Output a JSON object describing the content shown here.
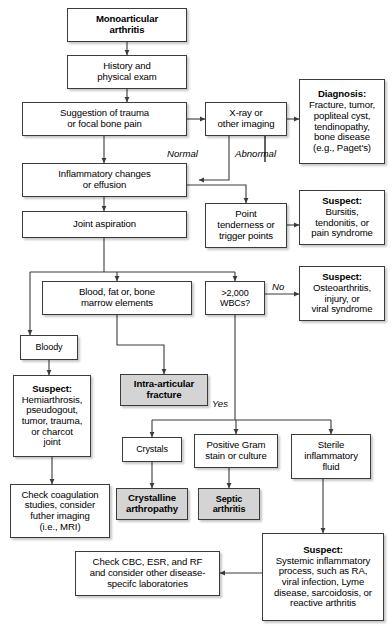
{
  "diagram": {
    "type": "clinical-flowchart",
    "nodes": [
      {
        "id": "monoarticular",
        "label": "Monoarticular\narthritis",
        "style": "bold",
        "x": 67,
        "y": 8,
        "w": 120,
        "h": 34
      },
      {
        "id": "history",
        "label": "History and\nphysical exam",
        "style": "plain",
        "x": 67,
        "y": 55,
        "w": 120,
        "h": 34
      },
      {
        "id": "suggestion",
        "label": "Suggestion of trauma\nor focal bone pain",
        "style": "plain",
        "x": 22,
        "y": 102,
        "w": 165,
        "h": 34
      },
      {
        "id": "xray",
        "label": "X-ray or\nother imaging",
        "style": "plain",
        "x": 205,
        "y": 102,
        "w": 82,
        "h": 34
      },
      {
        "id": "diagnosis",
        "label": "Fracture, tumor,\npopliteal cyst,\ntendinopathy,\nbone disease\n(e.g., Paget's)",
        "header": "Diagnosis:",
        "style": "header",
        "x": 299,
        "y": 79,
        "w": 86,
        "h": 85
      },
      {
        "id": "inflammatory",
        "label": "Inflammatory changes\nor effusion",
        "style": "plain",
        "x": 22,
        "y": 163,
        "w": 165,
        "h": 34
      },
      {
        "id": "jointasp",
        "label": "Joint aspiration",
        "style": "plain",
        "x": 22,
        "y": 211,
        "w": 165,
        "h": 27
      },
      {
        "id": "point",
        "label": "Point\ntenderness or\ntrigger points",
        "style": "plain",
        "x": 205,
        "y": 203,
        "w": 82,
        "h": 45
      },
      {
        "id": "suspect_bursitis",
        "label": "Bursitis,\ntendonitis, or\npain syndrome",
        "header": "Suspect:",
        "style": "header",
        "x": 299,
        "y": 190,
        "w": 86,
        "h": 55
      },
      {
        "id": "bloodfat",
        "label": "Blood, fat or, bone\nmarrow elements",
        "style": "plain",
        "x": 42,
        "y": 281,
        "w": 150,
        "h": 34
      },
      {
        "id": "wbc",
        "label": ">2,000\nWBCs?",
        "style": "plain",
        "x": 205,
        "y": 281,
        "w": 60,
        "h": 34
      },
      {
        "id": "suspect_osteo",
        "label": "Osteoarthritis,\ninjury, or\nviral syndrome",
        "header": "Suspect:",
        "style": "header",
        "x": 299,
        "y": 266,
        "w": 86,
        "h": 55
      },
      {
        "id": "bloody",
        "label": "Bloody",
        "style": "plain",
        "x": 20,
        "y": 335,
        "w": 58,
        "h": 25
      },
      {
        "id": "suspect_hemi",
        "label": "Hemiarthrosis,\npseudogout,\ntumor, trauma,\nor charcot\njoint",
        "header": "Suspect:",
        "style": "header",
        "x": 13,
        "y": 375,
        "w": 78,
        "h": 82
      },
      {
        "id": "intraarticular",
        "label": "Intra-articular\nfracture",
        "style": "shaded",
        "x": 120,
        "y": 374,
        "w": 88,
        "h": 32
      },
      {
        "id": "checkcoag",
        "label": "Check coagulation\nstudies, consider\nfuther imaging\n(i.e., MRI)",
        "style": "plain",
        "x": 10,
        "y": 484,
        "w": 100,
        "h": 54
      },
      {
        "id": "crystals",
        "label": "Crystals",
        "style": "plain",
        "x": 122,
        "y": 437,
        "w": 60,
        "h": 25
      },
      {
        "id": "gram",
        "label": "Positive Gram\nstain or culture",
        "style": "plain",
        "x": 194,
        "y": 434,
        "w": 84,
        "h": 34
      },
      {
        "id": "sterile",
        "label": "Sterile\ninflammatory\nfluid",
        "style": "plain",
        "x": 291,
        "y": 434,
        "w": 80,
        "h": 45
      },
      {
        "id": "crystalline",
        "label": "Crystalline\narthropathy",
        "style": "shaded",
        "x": 116,
        "y": 488,
        "w": 72,
        "h": 32
      },
      {
        "id": "septic",
        "label": "Septic\narthritis",
        "style": "shaded",
        "x": 198,
        "y": 488,
        "w": 62,
        "h": 32
      },
      {
        "id": "checkcbc",
        "label": "Check CBC, ESR, and RF\nand consider other disease-\nspecifc laboratories",
        "style": "plain",
        "x": 75,
        "y": 551,
        "w": 145,
        "h": 45
      },
      {
        "id": "suspect_systemic",
        "label": "Systemic inflammatory\nprocess, such as RA,\nviral infection, Lyme\ndisease, sarcoidosis, or\nreactive arthritis",
        "header": "Suspect:",
        "style": "header",
        "x": 262,
        "y": 533,
        "w": 122,
        "h": 88
      }
    ],
    "edge_labels": [
      {
        "id": "normal",
        "text": "Normal",
        "x": 167,
        "y": 148
      },
      {
        "id": "abnormal",
        "text": "Abnormal",
        "x": 235,
        "y": 148
      },
      {
        "id": "no",
        "text": "No",
        "x": 272,
        "y": 281
      },
      {
        "id": "yes",
        "text": "Yes",
        "x": 212,
        "y": 398
      }
    ],
    "colors": {
      "border": "#3b3b3b",
      "box_fill": "#ffffff",
      "shaded_fill": "#d4d4d4",
      "line": "#3b3b3b",
      "text": "#000000"
    }
  }
}
